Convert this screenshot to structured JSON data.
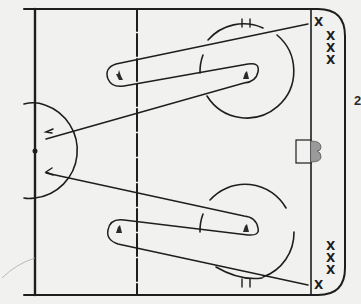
{
  "diagram": {
    "type": "hockey-drill",
    "page_label": "2",
    "colors": {
      "background": "#f1f1ef",
      "ink": "#1e1e1e",
      "net_fill": "#9a9a9a"
    },
    "players": {
      "top_group": [
        "X",
        "X",
        "X",
        "X"
      ],
      "bottom_group": [
        "X",
        "X",
        "X",
        "X"
      ]
    },
    "markers": {
      "top_pylons": [
        "cone",
        "cone"
      ],
      "bottom_pylons": [
        "cone",
        "cone"
      ]
    },
    "elements": [
      "boards",
      "blue-line",
      "center-line",
      "goal-line",
      "center-circle",
      "faceoff-circle-top",
      "faceoff-circle-bottom",
      "net",
      "skating-path-top",
      "skating-path-bottom",
      "pass-arrow-top",
      "pass-arrow-bottom"
    ]
  }
}
